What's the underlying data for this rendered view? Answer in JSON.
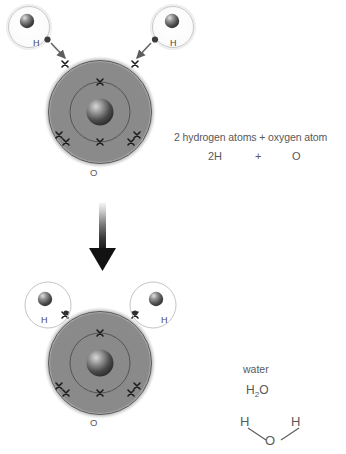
{
  "figure": {
    "title_implicit": "Formation of a water molecule from two hydrogen atoms and one oxygen atom",
    "background_color": "#ffffff",
    "text_color": "#58585a"
  },
  "reaction_arrow": {
    "name": "downward-arrow",
    "direction": "down",
    "gradient_from": "#f2f2f2",
    "gradient_to": "#1a1a1a"
  },
  "top_panel": {
    "caption_line1": "2 hydrogen atoms + oxygen atom",
    "equation": {
      "reactant_hydrogen": "2H",
      "operator": "+",
      "reactant_oxygen": "O"
    },
    "oxygen_atom": {
      "label": "O",
      "disc_color": "#8a8a8a",
      "shell_line_color": "#4e4e4e",
      "inner_shell_electrons": 2,
      "outer_shell_electrons": 6,
      "electron_symbol": "x",
      "nucleus_color": "#4f4f4f"
    },
    "hydrogen_atoms": [
      {
        "label": "H",
        "position": "top-left",
        "electron_symbol": "dot",
        "shell_color": "#cfcfcf"
      },
      {
        "label": "H",
        "position": "top-right",
        "electron_symbol": "dot",
        "shell_color": "#cfcfcf"
      }
    ],
    "bond_arrows": [
      {
        "name": "electron-transfer-arrow-left",
        "from": "hydrogen-left-electron",
        "to": "oxygen-outer-shell"
      },
      {
        "name": "electron-transfer-arrow-right",
        "from": "hydrogen-right-electron",
        "to": "oxygen-outer-shell"
      }
    ]
  },
  "bottom_panel": {
    "caption_line1": "water",
    "formula_main": "H",
    "formula_sub": "2",
    "formula_tail": "O",
    "structural_formula": {
      "hydrogen_left": "H",
      "hydrogen_right": "H",
      "oxygen": "O"
    },
    "oxygen_atom": {
      "label": "O",
      "disc_color": "#8a8a8a",
      "shell_line_color": "#4e4e4e",
      "inner_shell_electrons": 2,
      "outer_shell_electrons": 6,
      "electron_symbol": "x",
      "nucleus_color": "#4f4f4f"
    },
    "hydrogen_atoms": [
      {
        "label": "H",
        "position": "bottom-left",
        "electron_symbol": "dot",
        "shell_color": "#cfcfcf"
      },
      {
        "label": "H",
        "position": "bottom-right",
        "electron_symbol": "dot",
        "shell_color": "#cfcfcf"
      }
    ]
  }
}
